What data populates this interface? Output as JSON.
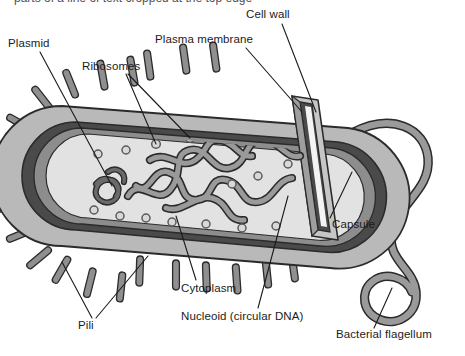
{
  "figure": {
    "organism": "bacterium",
    "view": "longitudinal cut-away",
    "cropped_top_text": "parts of a line of text cropped at the top edge"
  },
  "palette": {
    "background": "#ffffff",
    "outline": "#2b2b2b",
    "capsule_fill": "#b9b9b9",
    "cell_wall_fill": "#4a4a4a",
    "plasma_membrane_fill": "#8d8d8d",
    "cytoplasm_fill": "#dcdcdc",
    "cytoplasm_light": "#e6e6e6",
    "nucleoid_fill": "#9a9a9a",
    "plasmid_fill": "#6a6a6a",
    "ribosome_fill": "#d2d2d2",
    "pili_fill": "#8f8f8f",
    "flagellum_fill": "#9a9a9a",
    "cut_face_highlight": "#f4f4f4",
    "label_text": "#1b1b1b",
    "leader_line": "#1b1b1b"
  },
  "labels": [
    {
      "id": "plasmid",
      "text": "Plasmid",
      "x": 8,
      "y": 45,
      "anchor": "start"
    },
    {
      "id": "ribosomes",
      "text": "Ribosomes",
      "x": 82,
      "y": 68,
      "anchor": "start"
    },
    {
      "id": "plasma_membrane",
      "text": "Plasma membrane",
      "x": 155,
      "y": 41,
      "anchor": "start"
    },
    {
      "id": "cell_wall",
      "text": "Cell wall",
      "x": 246,
      "y": 16,
      "anchor": "start"
    },
    {
      "id": "capsule",
      "text": "Capsule",
      "x": 316,
      "y": 226,
      "anchor": "start"
    },
    {
      "id": "pili",
      "text": "Pili",
      "x": 78,
      "y": 327,
      "anchor": "start"
    },
    {
      "id": "cytoplasm",
      "text": "Cytoplasm",
      "x": 181,
      "y": 290,
      "anchor": "start"
    },
    {
      "id": "nucleoid",
      "text": "Nucleoid (circular DNA)",
      "x": 181,
      "y": 318,
      "anchor": "start"
    },
    {
      "id": "flagellum",
      "text": "Bacterial flagellum",
      "x": 336,
      "y": 336,
      "anchor": "start"
    }
  ],
  "structures": {
    "capsule": "outermost slime layer enclosing the cell",
    "cell_wall": "dark rigid layer beneath the capsule",
    "plasma_membrane": "thin layer inside the cell wall",
    "cytoplasm": "pale interior ground substance",
    "nucleoid": "tangled circular chromosome in the centre",
    "plasmid": "small separate circular DNA loop at the left",
    "ribosomes": "small circles scattered in the cytoplasm",
    "pili": "short rods projecting from the cell surface",
    "flagellum": "long whip-like S-curved tail at the right end"
  },
  "counts": {
    "pili_visible": 22,
    "ribosomes_visible": 14,
    "plasmids_visible": 1,
    "flagella_visible": 1
  }
}
